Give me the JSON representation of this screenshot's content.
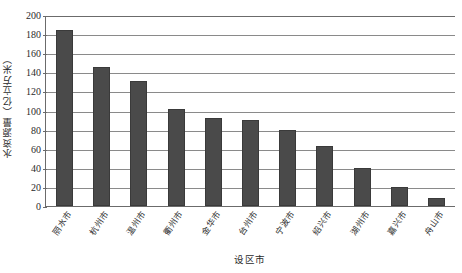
{
  "chart_data": {
    "type": "bar",
    "title": "",
    "subtitle": "",
    "xlabel": "设区市",
    "ylabel": "水资源量（亿立方米）",
    "categories": [
      "丽水市",
      "杭州市",
      "温州市",
      "衢州市",
      "金华市",
      "台州市",
      "宁波市",
      "绍兴市",
      "湖州市",
      "嘉兴市",
      "舟山市"
    ],
    "values": [
      184,
      146,
      131,
      102,
      92,
      90,
      80,
      63,
      40,
      20,
      8
    ],
    "series": [
      {
        "name": "水资源量",
        "values": [
          184,
          146,
          131,
          102,
          92,
          90,
          80,
          63,
          40,
          20,
          8
        ]
      }
    ],
    "ylim": [
      0,
      200
    ],
    "ytick_step": 20,
    "yticks": [
      "200",
      "180",
      "160",
      "140",
      "120",
      "100",
      "80",
      "60",
      "40",
      "20",
      "0"
    ],
    "ytick_values": [
      200,
      180,
      160,
      140,
      120,
      100,
      80,
      60,
      40,
      20,
      0
    ],
    "grid": true,
    "grid_axis": "y",
    "legend": false,
    "legend_position": "none",
    "bar_color": "#4a4a4a",
    "grid_color": "#8a8a8a",
    "axis_color": "#6b6b6b",
    "background_color": "#ffffff"
  }
}
